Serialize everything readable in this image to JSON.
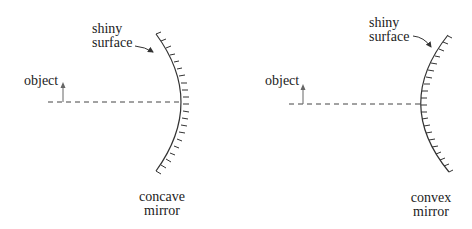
{
  "diagrams": [
    {
      "id": "concave",
      "object_label": "object",
      "surface_label_line1": "shiny",
      "surface_label_line2": "surface",
      "mirror_label_line1": "concave",
      "mirror_label_line2": "mirror"
    },
    {
      "id": "convex",
      "object_label": "object",
      "surface_label_line1": "shiny",
      "surface_label_line2": "surface",
      "mirror_label_line1": "convex",
      "mirror_label_line2": "mirror"
    }
  ],
  "colors": {
    "line": "#333333",
    "arrow": "#555555",
    "text": "#222222"
  }
}
